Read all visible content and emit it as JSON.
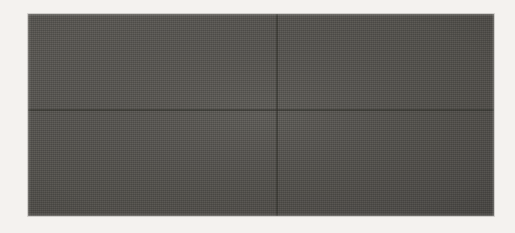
{
  "figure": {
    "kind": "oscilloscope-photograph",
    "caption": "",
    "background_color": "#f4f2ef"
  },
  "scope": {
    "screen": {
      "label": "oscilloscope-crt-screen",
      "x": 28,
      "y": 14,
      "width": 466,
      "height": 202,
      "phosphor_background_color": "#55534f",
      "trace_color": "#ece9e2",
      "graticule_color": "#3b3936"
    },
    "graticule": {
      "visible": true,
      "divisions_horizontal": 8,
      "divisions_vertical": 4,
      "vertical_line_x": [
        28,
        86,
        144,
        201,
        259,
        317,
        375,
        433,
        491
      ],
      "horizontal_line_y": [
        14,
        58,
        110,
        161,
        215
      ],
      "center_axis_y": 110,
      "center_axis_x": 277,
      "tick_marks_per_division": 5,
      "tick_mark_length": 5
    }
  },
  "chart_data": {
    "type": "line",
    "subtitle": "",
    "xlabel": "time (divisions)",
    "ylabel": "amplitude (divisions)",
    "xlim": [
      0,
      8
    ],
    "ylim": [
      -2,
      2
    ],
    "grid": true,
    "legend": "none",
    "annotations": [
      "envelope pinches to zero at each node",
      "three full envelope lobes visible across screen"
    ],
    "series": [
      {
        "name": "AM waveform",
        "carrier_frequency_cycles_per_screen": 62,
        "modulation_frequency_cycles_per_screen": 3,
        "modulation_index": 1.0,
        "peak_amplitude_divisions": 1.5,
        "node_positions_px": [
          35,
          192,
          347,
          490
        ],
        "lobe_peak_positions_px": [
          113,
          269,
          419
        ],
        "envelope_top_px": 33,
        "envelope_bottom_px": 188
      },
      {
        "name": "upper envelope",
        "values_description": "abs(cos) envelope, peak 1.5 div"
      },
      {
        "name": "lower envelope",
        "values_description": "negative mirror of upper envelope"
      }
    ]
  }
}
